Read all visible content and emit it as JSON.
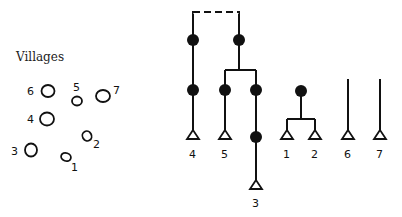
{
  "title": "Villages",
  "villages": [
    {
      "id": "1",
      "label": "1"
    },
    {
      "id": "2",
      "label": "2"
    },
    {
      "id": "3",
      "label": "3"
    },
    {
      "id": "4",
      "label": "4"
    },
    {
      "id": "5",
      "label": "5"
    },
    {
      "id": "6",
      "label": "6"
    },
    {
      "id": "7",
      "label": "7"
    }
  ],
  "diagram": {
    "leaf_labels": [
      "4",
      "5",
      "3",
      "1",
      "2",
      "6",
      "7"
    ],
    "line_color": "#111111",
    "node_color": "#111111"
  }
}
